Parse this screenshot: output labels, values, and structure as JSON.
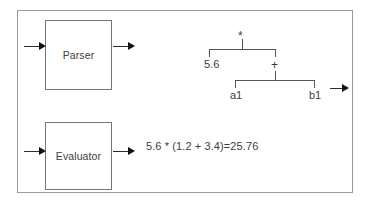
{
  "diagram": {
    "frame": {
      "name": "outer-frame",
      "border_color": "#9a9a9a",
      "background": "#ffffff"
    },
    "stages": [
      {
        "label": "Parser"
      },
      {
        "label": "Evaluator"
      }
    ],
    "arrows": {
      "parser_input": "input-arrow",
      "parser_output": "output-arrow",
      "evaluator_input": "input-arrow",
      "evaluator_output": "output-arrow",
      "final_output": "output-arrow"
    },
    "equation": "5.6 * (1.2 + 3.4)=25.76",
    "parse_tree": {
      "root": "*",
      "left_operand": "5.6",
      "operator": "+",
      "operand_a": "a1",
      "operand_b": "b1",
      "line_color": "#555555"
    },
    "text_color": "#3d3d3d"
  }
}
